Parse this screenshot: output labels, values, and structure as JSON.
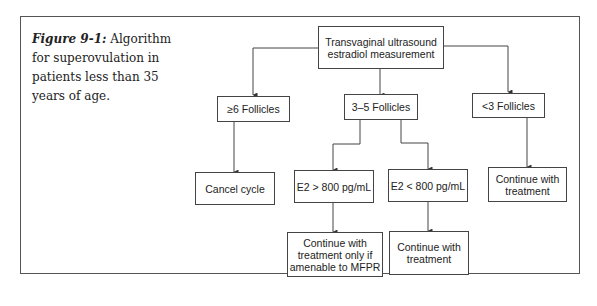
{
  "caption": {
    "label": "Figure 9-1:",
    "text": " Algorithm for superovulation in patients less than 35 years of age."
  },
  "nodes": {
    "root": "Transvaginal ultrasound estradiol measurement",
    "ge6": "≥6 Follicles",
    "f35": "3–5 Follicles",
    "lt3": "<3 Follicles",
    "cancel": "Cancel cycle",
    "e2hi": "E2 > 800 pg/mL",
    "e2lo": "E2 < 800 pg/mL",
    "cont_lt3": "Continue with treatment",
    "cont_hi": "Continue with treatment only if amenable to MFPR",
    "cont_lo": "Continue with treatment"
  }
}
